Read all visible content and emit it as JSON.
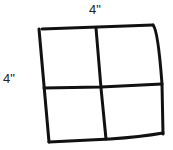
{
  "diagram": {
    "type": "grid-square",
    "rows": 2,
    "cols": 2,
    "labels": {
      "top": "4\"",
      "left": "4\""
    },
    "stroke_color": "#111111",
    "background": "#ffffff"
  }
}
